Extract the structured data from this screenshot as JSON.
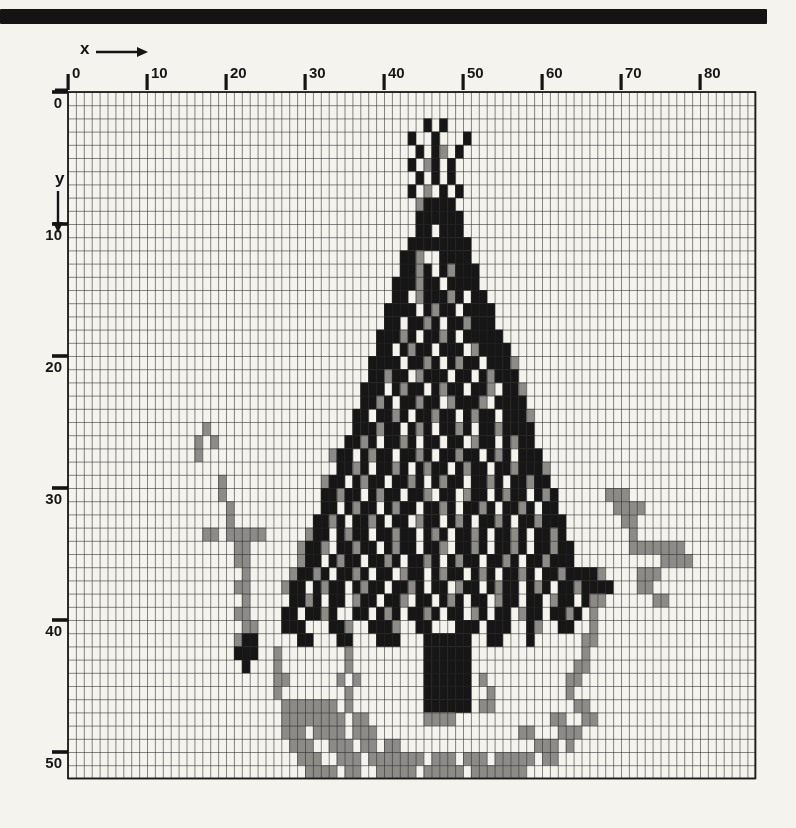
{
  "page": {
    "background_color": "#f5f3ee",
    "top_rule_color": "#141414"
  },
  "chart_data": {
    "type": "heatmap",
    "title": "",
    "xlabel": "x",
    "ylabel": "y",
    "x_ticks": [
      0,
      10,
      20,
      30,
      40,
      50,
      60,
      70,
      80
    ],
    "y_ticks": [
      0,
      10,
      20,
      30,
      40,
      50
    ],
    "x_range": [
      0,
      86
    ],
    "y_range": [
      0,
      51
    ],
    "legend_position": "none",
    "grid": {
      "cols": 87,
      "rows": 52,
      "cell_width": 7.9,
      "cell_height": 13.2,
      "origin_x": 68,
      "origin_y": 92,
      "line_color": "rgba(40,40,40,0.55)",
      "border_color": "#1c1c1c",
      "tick_color": "#141414"
    },
    "palette": {
      "B": "#161616",
      "G": "#8d8b88"
    },
    "pixel_rows": [
      {
        "y": 2,
        "runs": [
          [
            45,
            "B.B"
          ]
        ]
      },
      {
        "y": 3,
        "runs": [
          [
            43,
            "B..B...B"
          ]
        ]
      },
      {
        "y": 4,
        "runs": [
          [
            44,
            "B.BG.B"
          ]
        ]
      },
      {
        "y": 5,
        "runs": [
          [
            43,
            "B.GB.B"
          ]
        ]
      },
      {
        "y": 6,
        "runs": [
          [
            44,
            "B.B.B"
          ]
        ]
      },
      {
        "y": 7,
        "runs": [
          [
            43,
            "B.G.B.B"
          ]
        ]
      },
      {
        "y": 8,
        "runs": [
          [
            44,
            "GBBBB"
          ]
        ]
      },
      {
        "y": 9,
        "runs": [
          [
            44,
            "BBBBBB"
          ]
        ]
      },
      {
        "y": 10,
        "runs": [
          [
            44,
            "BB.BBB"
          ]
        ]
      },
      {
        "y": 11,
        "runs": [
          [
            43,
            "BBBBBBBB"
          ]
        ]
      },
      {
        "y": 12,
        "runs": [
          [
            42,
            "BBG..BBBB"
          ]
        ]
      },
      {
        "y": 13,
        "runs": [
          [
            42,
            "BBGB.BGBBB"
          ]
        ]
      },
      {
        "y": 14,
        "runs": [
          [
            41,
            "BBBGBB.BBBB"
          ]
        ]
      },
      {
        "y": 15,
        "runs": [
          [
            41,
            "BB.GBBBGB.BB"
          ]
        ]
      },
      {
        "y": 16,
        "runs": [
          [
            40,
            "BBBB.BGBB.BBBB"
          ]
        ]
      },
      {
        "y": 17,
        "runs": [
          [
            40,
            "BB.BBGB.BBGBBB"
          ]
        ]
      },
      {
        "y": 18,
        "runs": [
          [
            39,
            "BBBGB.BBGB.BBBBB"
          ]
        ]
      },
      {
        "y": 19,
        "runs": [
          [
            39,
            "BB.BGBB.BBB.GBBBB"
          ]
        ]
      },
      {
        "y": 20,
        "runs": [
          [
            38,
            "BBBB.BBGB.BGBB.BBBG"
          ]
        ]
      },
      {
        "y": 21,
        "runs": [
          [
            38,
            "BBGBB.GBBB.BB.BGBBB"
          ]
        ]
      },
      {
        "y": 22,
        "runs": [
          [
            37,
            "BBB.BGBB.BGBB.BBG.BBG"
          ]
        ]
      },
      {
        "y": 23,
        "runs": [
          [
            37,
            "BBGB.BBGBB.GBBBG.BBBB"
          ]
        ]
      },
      {
        "y": 24,
        "runs": [
          [
            36,
            "BB.BBGB.BBGBB.BGBB.BBBG"
          ]
        ]
      },
      {
        "y": 25,
        "runs": [
          [
            17,
            "G"
          ],
          [
            36,
            "BBBGBB.BGB.BBGB.BBGBBBB"
          ]
        ]
      },
      {
        "y": 26,
        "runs": [
          [
            16,
            "G.G"
          ],
          [
            35,
            "BBGB.BBGB.BB.BB.GBB.BGBB"
          ]
        ]
      },
      {
        "y": 27,
        "runs": [
          [
            16,
            "G"
          ],
          [
            33,
            "GBB.BGBB.BBGB.BBGBB.BGB.BBB"
          ]
        ]
      },
      {
        "y": 28,
        "runs": [
          [
            34,
            "BBGB.BBGB.BGBB.BGBB.BBGBBBG"
          ]
        ]
      },
      {
        "y": 29,
        "runs": [
          [
            19,
            "G"
          ],
          [
            32,
            "GBB.BGBB.BBGB.BGBB.BBGB.BBGBB"
          ]
        ]
      },
      {
        "y": 30,
        "runs": [
          [
            19,
            "G"
          ],
          [
            32,
            "BBGBB.BGBB.BBG.BB.GBB.BGBB.BGB"
          ],
          [
            68,
            "GGG"
          ]
        ]
      },
      {
        "y": 31,
        "runs": [
          [
            20,
            "G"
          ],
          [
            32,
            "BB.BGBB.BGBB.BBGB.BBGB.BBGB.BB"
          ],
          [
            69,
            "GGGG"
          ]
        ]
      },
      {
        "y": 32,
        "runs": [
          [
            20,
            "G"
          ],
          [
            31,
            "BBGB.BBGB.BB.GBB.BGB.BBGB.BBGBBB"
          ],
          [
            70,
            "GG"
          ]
        ]
      },
      {
        "y": 33,
        "runs": [
          [
            17,
            "GG.GGGGG"
          ],
          [
            30,
            "GBB.BGBB.BBGBB.BGB.BBGB.BBGB.BBGB"
          ],
          [
            71,
            "G"
          ]
        ]
      },
      {
        "y": 34,
        "runs": [
          [
            21,
            "GG"
          ],
          [
            29,
            "GBBG.BBGBB.BGBB.BBG.BBGB.BBGB.BBGBB"
          ],
          [
            71,
            "GGGGGGG"
          ]
        ]
      },
      {
        "y": 35,
        "runs": [
          [
            21,
            "GG"
          ],
          [
            29,
            "GBB.BGBB.BBGB.BBGB.BGBB.BBGB.BBGBBB"
          ],
          [
            75,
            "GGGG"
          ]
        ]
      },
      {
        "y": 36,
        "runs": [
          [
            22,
            "G"
          ],
          [
            28,
            "GBBGB.BBGB.BB.GBB.BGBB.BGB.BBGB.BBGBBBBG"
          ],
          [
            72,
            "GGG"
          ]
        ]
      },
      {
        "y": 37,
        "runs": [
          [
            21,
            "GG"
          ],
          [
            27,
            "GBB.BGBB.BGBB.BBGB.BB.GBB.BGBB.BGB.BBGBBBB"
          ],
          [
            72,
            "GG"
          ]
        ]
      },
      {
        "y": 38,
        "runs": [
          [
            22,
            "G"
          ],
          [
            28,
            "BBGB.BB.GBB.BBG.BB.BGB.BB.GBB.BB.GBB.BGG"
          ],
          [
            74,
            "GG"
          ]
        ]
      },
      {
        "y": 39,
        "runs": [
          [
            21,
            "GG"
          ],
          [
            27,
            "BB.BBGB..BB.BGB.BBGB.BB.GB.BB.GBB.BBGB.G"
          ]
        ]
      },
      {
        "y": 40,
        "runs": [
          [
            22,
            "GG"
          ],
          [
            27,
            "BBB...BBG..BBBG..BB...BBB.BBB..BG..BB..G"
          ]
        ]
      },
      {
        "y": 41,
        "runs": [
          [
            21,
            "GBB"
          ],
          [
            29,
            "BB...BB...BBB...BBBBBB..BB...B......GG"
          ]
        ]
      },
      {
        "y": 42,
        "runs": [
          [
            21,
            "BBB"
          ],
          [
            26,
            "G"
          ],
          [
            35,
            "G"
          ],
          [
            45,
            "BBBBBB"
          ],
          [
            65,
            "G"
          ]
        ]
      },
      {
        "y": 43,
        "runs": [
          [
            22,
            "B"
          ],
          [
            26,
            "G"
          ],
          [
            35,
            "G"
          ],
          [
            45,
            "BBBBBB"
          ],
          [
            64,
            "GG"
          ]
        ]
      },
      {
        "y": 44,
        "runs": [
          [
            26,
            "GG"
          ],
          [
            34,
            "G.G"
          ],
          [
            45,
            "BBBBBB.G"
          ],
          [
            63,
            "GG"
          ]
        ]
      },
      {
        "y": 45,
        "runs": [
          [
            26,
            "G"
          ],
          [
            35,
            "G"
          ],
          [
            45,
            "BBBBBB..G"
          ],
          [
            63,
            "G"
          ]
        ]
      },
      {
        "y": 46,
        "runs": [
          [
            27,
            "GGGGGGG.G"
          ],
          [
            45,
            "BBBBBB.GG"
          ],
          [
            64,
            "GG"
          ]
        ]
      },
      {
        "y": 47,
        "runs": [
          [
            27,
            "GGGGGGGG.GG"
          ],
          [
            45,
            "GGGG"
          ],
          [
            61,
            "GG"
          ],
          [
            65,
            "GG"
          ]
        ]
      },
      {
        "y": 48,
        "runs": [
          [
            27,
            "GGG.GGGG.GGG"
          ],
          [
            57,
            "GG"
          ],
          [
            62,
            "GGG"
          ]
        ]
      },
      {
        "y": 49,
        "runs": [
          [
            28,
            "GGG..GGG.GG.GG"
          ],
          [
            59,
            "GGG.G"
          ]
        ]
      },
      {
        "y": 50,
        "runs": [
          [
            29,
            "GGG..GGG.GGGGGGG.GGG.GGG.GGGGG.GG"
          ]
        ]
      },
      {
        "y": 51,
        "runs": [
          [
            30,
            "GGGG.GG..GGGGG.GGGGG.GGGGGGG"
          ]
        ]
      }
    ]
  }
}
